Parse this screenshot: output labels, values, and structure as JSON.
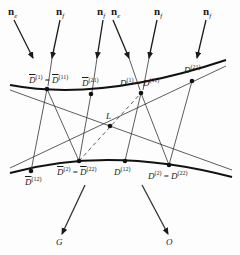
{
  "diagram": {
    "incoming_rays": [
      {
        "label": "n",
        "sub": "e",
        "x": 12
      },
      {
        "label": "n",
        "sub": "f",
        "x": 58
      },
      {
        "label": "n",
        "sub": "f",
        "x": 97
      },
      {
        "label": "n",
        "sub": "e",
        "x": 112
      },
      {
        "label": "n",
        "sub": "f",
        "x": 155
      },
      {
        "label": "n",
        "sub": "f",
        "x": 204
      }
    ],
    "top_points": [
      {
        "base": "D",
        "bar": true,
        "sup": "(1)",
        "eq_base": "D",
        "eq_bar": true,
        "eq_sup": "(11)"
      },
      {
        "base": "D",
        "bar": true,
        "sup": "(21)"
      },
      {
        "base": "D",
        "bar": false,
        "sup": "(1)",
        "eq_base": "D",
        "eq_bar": false,
        "eq_sup": "(11)"
      },
      {
        "base": "D",
        "bar": false,
        "sup": "(21)"
      }
    ],
    "bottom_points": [
      {
        "base": "D",
        "bar": true,
        "sup": "(12)"
      },
      {
        "base": "D",
        "bar": true,
        "sup": "(2)",
        "eq_base": "D",
        "eq_bar": true,
        "eq_sup": "(22)"
      },
      {
        "base": "D",
        "bar": false,
        "sup": "(12)"
      },
      {
        "base": "D",
        "bar": false,
        "sup": "(2)",
        "eq_base": "D",
        "eq_bar": false,
        "eq_sup": "(22)"
      }
    ],
    "center_point": "L",
    "outgoing": [
      "G",
      "O"
    ],
    "eq": "="
  }
}
